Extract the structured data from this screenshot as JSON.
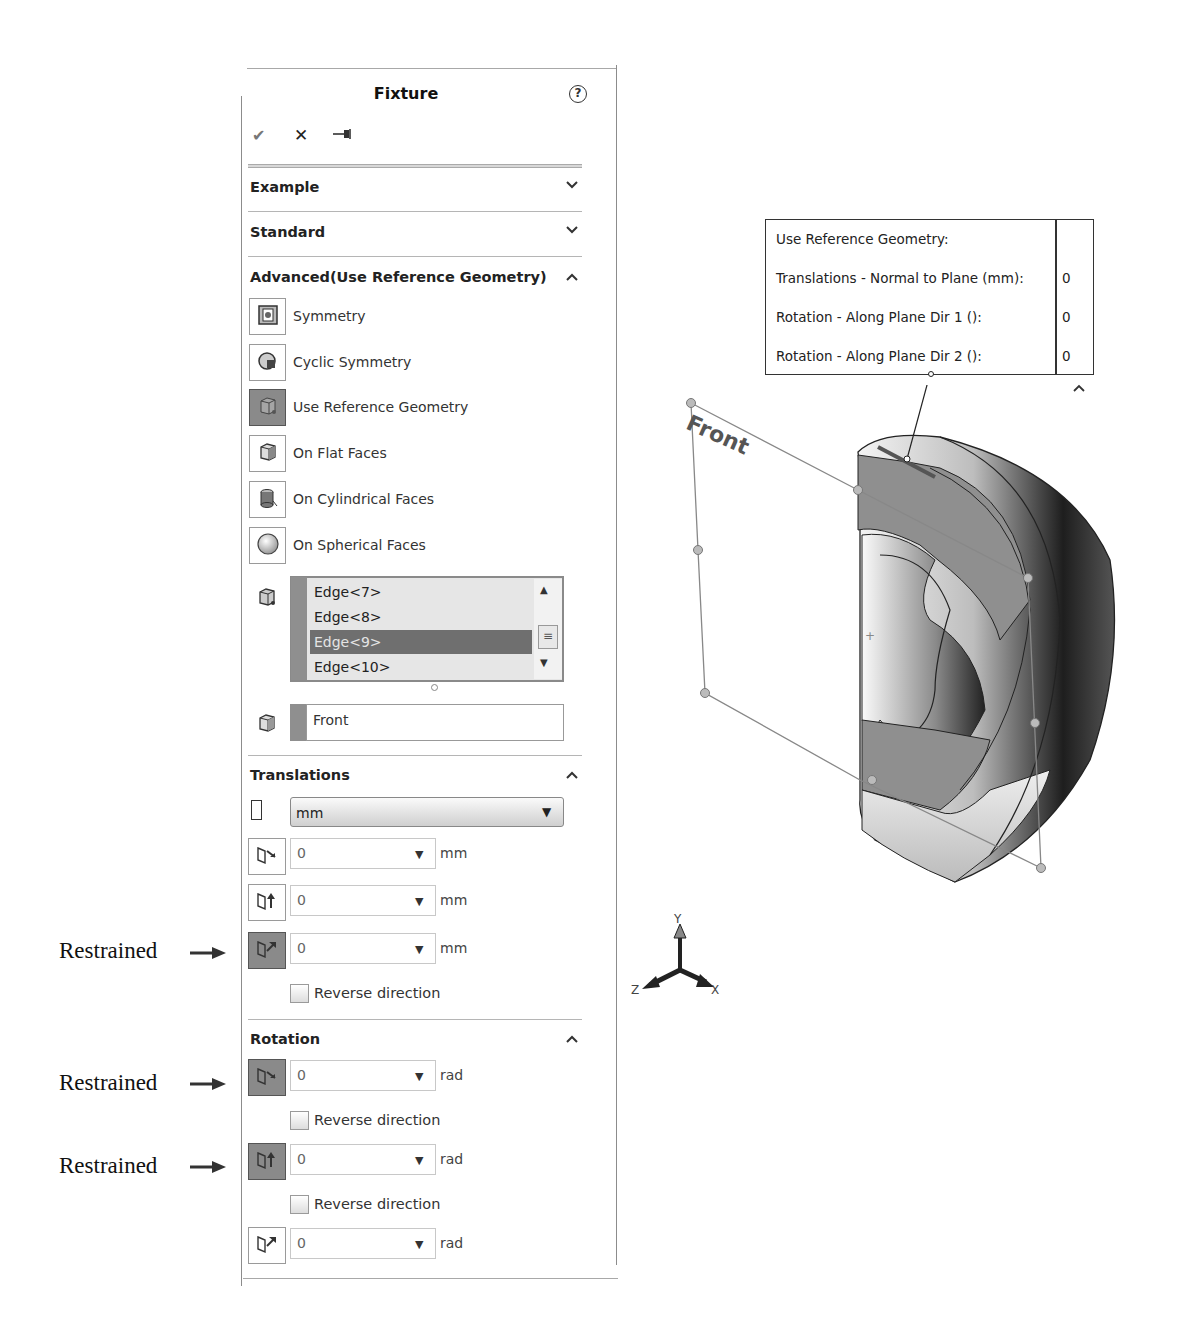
{
  "panel": {
    "title": "Fixture",
    "help_icon": "help-circle-icon",
    "toolbar": {
      "ok_icon": "✔",
      "cancel_icon": "✕",
      "pin_icon": "⇥"
    },
    "sections": {
      "example": {
        "label": "Example",
        "state": "collapsed",
        "chevron": "⌄"
      },
      "standard": {
        "label": "Standard",
        "state": "collapsed",
        "chevron": "⌄"
      },
      "advanced": {
        "label": "Advanced(Use Reference Geometry)",
        "state": "expanded",
        "chevron": "^"
      },
      "translations": {
        "label": "Translations",
        "state": "expanded",
        "chevron": "^"
      },
      "rotation": {
        "label": "Rotation",
        "state": "expanded",
        "chevron": "^"
      }
    },
    "advanced_options": [
      {
        "label": "Symmetry",
        "icon": "symmetry-icon",
        "active": false
      },
      {
        "label": "Cyclic Symmetry",
        "icon": "cyclic-symmetry-icon",
        "active": false
      },
      {
        "label": "Use Reference Geometry",
        "icon": "reference-geometry-icon",
        "active": true
      },
      {
        "label": "On Flat Faces",
        "icon": "flat-faces-icon",
        "active": false
      },
      {
        "label": "On Cylindrical Faces",
        "icon": "cylindrical-faces-icon",
        "active": false
      },
      {
        "label": "On Spherical Faces",
        "icon": "spherical-faces-icon",
        "active": false
      }
    ],
    "entities_list": {
      "items": [
        "Edge<7>",
        "Edge<8>",
        "Edge<9>",
        "Edge<10>"
      ],
      "selected_index": 2
    },
    "reference": {
      "value": "Front"
    },
    "translations": {
      "unit": "mm",
      "rows": [
        {
          "value": "0",
          "unit": "mm",
          "active": false
        },
        {
          "value": "0",
          "unit": "mm",
          "active": false
        },
        {
          "value": "0",
          "unit": "mm",
          "active": true
        }
      ],
      "reverse_label": "Reverse direction"
    },
    "rotation": {
      "rows": [
        {
          "value": "0",
          "unit": "rad",
          "active": true,
          "reverse_label": "Reverse direction"
        },
        {
          "value": "0",
          "unit": "rad",
          "active": true,
          "reverse_label": "Reverse direction"
        },
        {
          "value": "0",
          "unit": "rad",
          "active": false
        }
      ]
    }
  },
  "annotations": [
    "Restrained",
    "Restrained",
    "Restrained"
  ],
  "callout": {
    "rows": [
      {
        "label": "Use Reference Geometry:",
        "value": ""
      },
      {
        "label": "Translations - Normal to Plane (mm):",
        "value": "0"
      },
      {
        "label": "Rotation - Along Plane Dir 1 ():",
        "value": "0"
      },
      {
        "label": "Rotation - Along Plane Dir 2 ():",
        "value": "0"
      }
    ],
    "collapse_chevron": "^"
  },
  "viewport": {
    "plane_label": "Front",
    "triad": {
      "x": "X",
      "y": "Y",
      "z": "Z"
    },
    "origin_marker": "+"
  },
  "colors": {
    "active_button": "#8a8a8a",
    "selected_item": "#6f6f6f",
    "panel_border": "#8c8c8c"
  }
}
